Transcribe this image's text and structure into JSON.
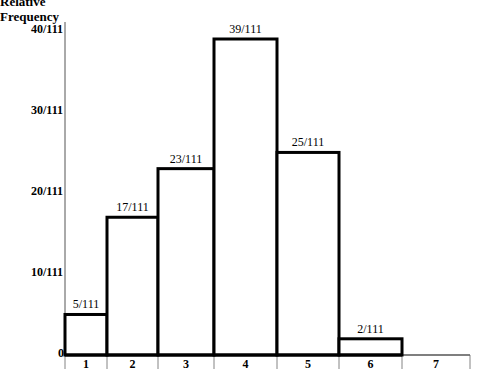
{
  "chart_data": {
    "type": "bar",
    "title": "",
    "xlabel": "",
    "ylabel": "Relative Frequency",
    "categories": [
      "1",
      "2",
      "3",
      "4",
      "5",
      "6",
      "7"
    ],
    "values": [
      5,
      17,
      23,
      39,
      25,
      2,
      0
    ],
    "denominator": 111,
    "bar_labels": [
      "5/111",
      "17/111",
      "23/111",
      "39/111",
      "25/111",
      "2/111",
      ""
    ],
    "y_ticks": [
      "0",
      "10/111",
      "20/111",
      "30/111",
      "40/111"
    ],
    "ylim": [
      0,
      41
    ],
    "grid": false,
    "legend": null,
    "bar_fill": "#ffffff",
    "bar_stroke": "#000000"
  },
  "axis": {
    "ylabel_line1": "Relative",
    "ylabel_line2": "Frequency"
  }
}
